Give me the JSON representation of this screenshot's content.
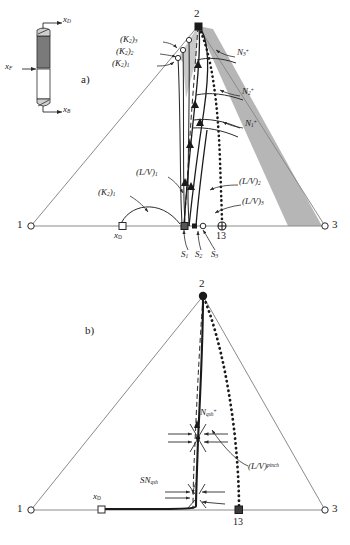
{
  "figure": {
    "type": "ternary-composition-diagram",
    "panels": [
      "a)",
      "b)"
    ],
    "colors": {
      "line": "#2b2b2b",
      "triangle_edge": "#8a8a8a",
      "shaded_region": "#b4b4b4",
      "column_rectifying": "#777777",
      "column_stripping": "#ffffff",
      "background": "#ffffff"
    }
  },
  "column_sketch": {
    "name": "distillation-column",
    "streams": {
      "distillate": "x",
      "distillate_sub": "D",
      "feed": "x",
      "feed_sub": "F",
      "bottoms": "x",
      "bottoms_sub": "B"
    }
  },
  "panel_a": {
    "label": "a)",
    "vertices": {
      "v1": "1",
      "v2": "2",
      "v3": "3"
    },
    "markers": {
      "xD": "x",
      "xD_sub": "D",
      "node13": "13"
    },
    "k_labels": [
      {
        "base": "(K",
        "sub2": "2",
        "close": ")",
        "idx": "1"
      },
      {
        "base": "(K",
        "sub2": "2",
        "close": ")",
        "idx": "2"
      },
      {
        "base": "(K",
        "sub2": "2",
        "close": ")",
        "idx": "3"
      }
    ],
    "k_bottom_label": {
      "base": "(K",
      "sub2": "2",
      "close": ")",
      "idx": "1"
    },
    "n_labels": [
      {
        "base": "N",
        "sub": "1",
        "sup": "+"
      },
      {
        "base": "N",
        "sub": "2",
        "sup": "+"
      },
      {
        "base": "N",
        "sub": "3",
        "sup": "+"
      }
    ],
    "lv_labels": [
      {
        "base": "(L/V)",
        "sub": "1"
      },
      {
        "base": "(L/V)",
        "sub": "2"
      },
      {
        "base": "(L/V)",
        "sub": "3"
      }
    ],
    "s_labels": [
      {
        "base": "S",
        "sub": "1"
      },
      {
        "base": "S",
        "sub": "2"
      },
      {
        "base": "S",
        "sub": "3"
      }
    ]
  },
  "panel_b": {
    "label": "b)",
    "vertices": {
      "v1": "1",
      "v2": "2",
      "v3": "3"
    },
    "markers": {
      "xD": "x",
      "xD_sub": "D",
      "node13": "13"
    },
    "saddle_node_label": {
      "base": "SN",
      "sub": "qsh"
    },
    "node_label": {
      "base": "N",
      "sub": "qsh",
      "sup": "+"
    },
    "pinch_label": {
      "base": "(L/V)",
      "sup": "pinch"
    }
  }
}
